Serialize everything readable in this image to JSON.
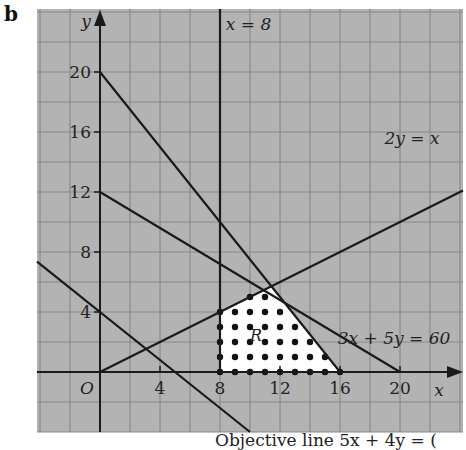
{
  "part_label": "b",
  "caption": "Objective line   5x + 4y = (",
  "colors": {
    "grid_bg": "#b3b3b3",
    "grid_line": "#8a8a8a",
    "line": "#1a1a1a",
    "region": "#ffffff",
    "dot": "#111111"
  },
  "labels": {
    "x_axis": "x",
    "y_axis": "y",
    "origin": "O",
    "line_x8": "x = 8",
    "line_2y": "2y = x",
    "line_3x5y": "3x + 5y = 60",
    "region": "R"
  },
  "chart_data": {
    "type": "line",
    "title": "",
    "xlabel": "x",
    "ylabel": "y",
    "xlim": [
      -4.2,
      24.2
    ],
    "ylim": [
      -4,
      24.2
    ],
    "grid": true,
    "grid_step": 2,
    "x_ticks": [
      4,
      8,
      12,
      16,
      20
    ],
    "y_ticks": [
      4,
      8,
      12,
      16,
      20
    ],
    "lines": [
      {
        "name": "x = 8",
        "points": [
          [
            8,
            0
          ],
          [
            8,
            24.2
          ]
        ],
        "label": "x = 8"
      },
      {
        "name": "2y = x",
        "points": [
          [
            0,
            0
          ],
          [
            24.2,
            12.1
          ]
        ],
        "label": "2y = x"
      },
      {
        "name": "3x + 5y = 60",
        "points": [
          [
            0,
            12
          ],
          [
            20,
            0
          ]
        ],
        "label": "3x + 5y = 60"
      },
      {
        "name": "5x + 4y = 80",
        "points": [
          [
            0,
            20
          ],
          [
            16,
            0
          ]
        ],
        "label": ""
      },
      {
        "name": "objective line 4x + 5y = 20",
        "points": [
          [
            -4.2,
            7.36
          ],
          [
            10,
            -4
          ]
        ],
        "label": ""
      }
    ],
    "feasible_region": {
      "label": "R",
      "vertices": [
        [
          8,
          0
        ],
        [
          8,
          4
        ],
        [
          11.43,
          5.71
        ],
        [
          16,
          0
        ]
      ]
    },
    "integer_points": [
      [
        8,
        0
      ],
      [
        9,
        0
      ],
      [
        10,
        0
      ],
      [
        11,
        0
      ],
      [
        12,
        0
      ],
      [
        13,
        0
      ],
      [
        14,
        0
      ],
      [
        15,
        0
      ],
      [
        16,
        0
      ],
      [
        8,
        1
      ],
      [
        9,
        1
      ],
      [
        10,
        1
      ],
      [
        11,
        1
      ],
      [
        12,
        1
      ],
      [
        13,
        1
      ],
      [
        14,
        1
      ],
      [
        15,
        1
      ],
      [
        8,
        2
      ],
      [
        9,
        2
      ],
      [
        10,
        2
      ],
      [
        11,
        2
      ],
      [
        12,
        2
      ],
      [
        13,
        2
      ],
      [
        14,
        2
      ],
      [
        8,
        3
      ],
      [
        9,
        3
      ],
      [
        10,
        3
      ],
      [
        11,
        3
      ],
      [
        12,
        3
      ],
      [
        13,
        3
      ],
      [
        8,
        4
      ],
      [
        9,
        4
      ],
      [
        10,
        4
      ],
      [
        11,
        4
      ],
      [
        12,
        4
      ],
      [
        10,
        5
      ],
      [
        11,
        5
      ]
    ]
  }
}
